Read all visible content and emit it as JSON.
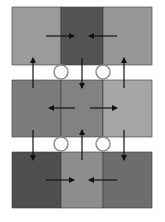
{
  "diagram": {
    "title": "",
    "background": "#ffffff",
    "rows": [
      {
        "id": "row-1",
        "y": 7,
        "height": 58,
        "cells": [
          {
            "id": "r1c1",
            "x": 12,
            "width": 49,
            "color": "#9b9b9b"
          },
          {
            "id": "r1c2",
            "x": 61,
            "width": 42,
            "color": "#545454"
          },
          {
            "id": "r1c3",
            "x": 103,
            "width": 49,
            "color": "#979797"
          }
        ],
        "horizontal_arrows": [
          {
            "direction": "right",
            "x1": 46,
            "x2": 74,
            "y": 36
          },
          {
            "direction": "left",
            "x1": 117,
            "x2": 89,
            "y": 36
          }
        ]
      },
      {
        "id": "row-2",
        "y": 80,
        "height": 57,
        "cells": [
          {
            "id": "r2c1",
            "x": 12,
            "width": 49,
            "color": "#7c7c7c"
          },
          {
            "id": "r2c2",
            "x": 61,
            "width": 42,
            "color": "#828282"
          },
          {
            "id": "r2c3",
            "x": 103,
            "width": 49,
            "color": "#a6a6a6"
          }
        ],
        "horizontal_arrows": [
          {
            "direction": "left",
            "x1": 75,
            "x2": 49,
            "y": 108
          },
          {
            "direction": "right",
            "x1": 90,
            "x2": 117,
            "y": 108
          }
        ]
      },
      {
        "id": "row-3",
        "y": 152,
        "height": 56,
        "cells": [
          {
            "id": "r3c1",
            "x": 12,
            "width": 49,
            "color": "#4f4f4f"
          },
          {
            "id": "r3c2",
            "x": 61,
            "width": 42,
            "color": "#8d8d8d"
          },
          {
            "id": "r3c3",
            "x": 103,
            "width": 49,
            "color": "#6d6d6d"
          }
        ],
        "horizontal_arrows": [
          {
            "direction": "right",
            "x1": 46,
            "x2": 74,
            "y": 180
          },
          {
            "direction": "left",
            "x1": 117,
            "x2": 89,
            "y": 180
          }
        ]
      }
    ],
    "vertical_arrows": [
      {
        "id": "up-left-1",
        "direction": "up",
        "x": 33,
        "y1": 88,
        "y2": 58
      },
      {
        "id": "down-mid-1",
        "direction": "down",
        "x": 82,
        "y1": 58,
        "y2": 88
      },
      {
        "id": "up-right-1",
        "direction": "up",
        "x": 124,
        "y1": 88,
        "y2": 58
      },
      {
        "id": "down-left-2",
        "direction": "down",
        "x": 33,
        "y1": 130,
        "y2": 160
      },
      {
        "id": "up-mid-2",
        "direction": "up",
        "x": 82,
        "y1": 160,
        "y2": 130
      },
      {
        "id": "down-right-2",
        "direction": "down",
        "x": 124,
        "y1": 130,
        "y2": 160
      }
    ],
    "connectors": [
      {
        "id": "circle-top-left",
        "cx": 61,
        "cy": 72,
        "r": 7
      },
      {
        "id": "circle-top-right",
        "cx": 103,
        "cy": 72,
        "r": 7
      },
      {
        "id": "circle-bottom-left",
        "cx": 61,
        "cy": 144,
        "r": 7
      },
      {
        "id": "circle-bottom-right",
        "cx": 103,
        "cy": 144,
        "r": 7
      }
    ],
    "colors": {
      "arrow": "#111111",
      "cell_border": "#3a3a3a",
      "circle_fill": "#ffffff",
      "circle_stroke": "#8a8a8a"
    }
  }
}
